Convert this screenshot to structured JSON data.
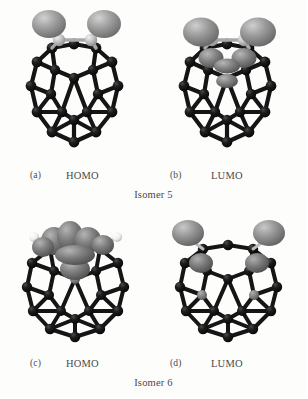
{
  "figure": {
    "background_color": "#fdfdfc",
    "panels": [
      {
        "tag": "(a)",
        "label": "HOMO",
        "isomer": "Isomer 5",
        "position": "top-left"
      },
      {
        "tag": "(b)",
        "label": "LUMO",
        "isomer": "Isomer 5",
        "position": "top-right"
      },
      {
        "tag": "(c)",
        "label": "HOMO",
        "isomer": "Isomer 6",
        "position": "bottom-left"
      },
      {
        "tag": "(d)",
        "label": "LUMO",
        "isomer": "Isomer 6",
        "position": "bottom-right"
      }
    ],
    "group_labels": [
      {
        "text": "Isomer 5"
      },
      {
        "text": "Isomer 6"
      }
    ],
    "colors": {
      "cage_atom": "#141414",
      "cage_bond": "#1b1b1b",
      "orbital_lobe": "#8f8f8f",
      "orbital_lobe_dark": "#6d6d6d",
      "substituent_atom": "#c9c9c9",
      "hydrogen_atom": "#f2f2f2",
      "text": "#4a4a4a",
      "background": "#fdfdfc"
    },
    "bottom_cropped_text": ""
  }
}
